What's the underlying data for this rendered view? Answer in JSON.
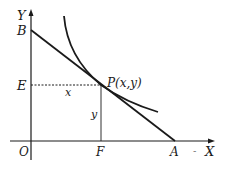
{
  "diagram": {
    "colors": {
      "ink": "#1a1a1a",
      "background": "#ffffff"
    },
    "axes": {
      "x_label": "X",
      "y_label": "Y",
      "origin_label": "O",
      "x_arrow_prefix": "-"
    },
    "points": {
      "B": {
        "label": "B"
      },
      "E": {
        "label": "E"
      },
      "P": {
        "label": "P(x,y)"
      },
      "F": {
        "label": "F"
      },
      "A": {
        "label": "A"
      }
    },
    "segment_labels": {
      "EP": "x",
      "FP": "y"
    }
  }
}
